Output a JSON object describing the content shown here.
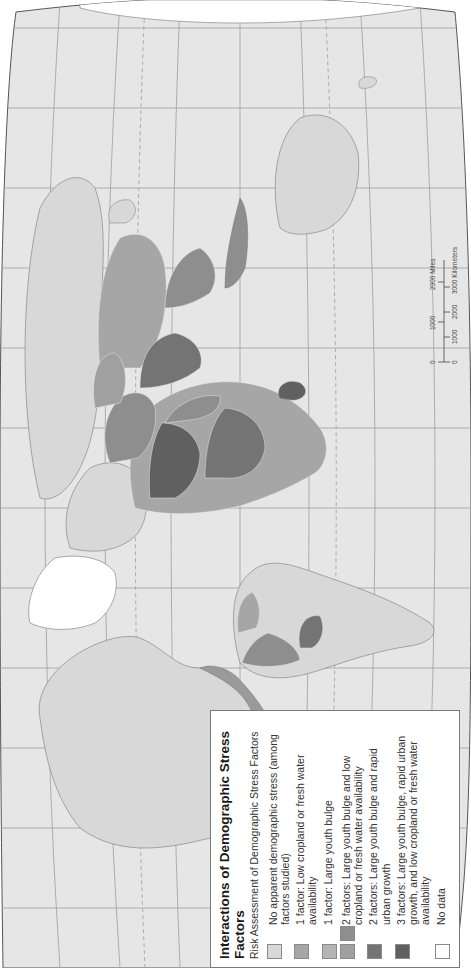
{
  "legend": {
    "title": "Interactions of Demographic Stress Factors",
    "subtitle": "Risk Assessment of Demographic Stress Factors",
    "items": [
      {
        "label": "No apparent demographic stress (among factors studied)",
        "colors": [
          "#d8d8d8"
        ]
      },
      {
        "label": "1 factor: Low cropland or fresh water availability",
        "colors": [
          "#a6a6a6"
        ]
      },
      {
        "label": "1 factor: Large youth bulge",
        "colors": [
          "#b4b4b4"
        ]
      },
      {
        "label": "2 factors: Large youth bulge and low cropland or fresh water availability",
        "colors": [
          "#a0a0a0",
          "#8e8e8e"
        ]
      },
      {
        "label": "2 factors: Large youth bulge and rapid urban growth",
        "colors": [
          "#747474"
        ]
      },
      {
        "label": "3 factors: Large youth bulge, rapid urban growth, and low cropland or fresh water availability",
        "colors": [
          "#606060"
        ]
      },
      {
        "label": "No data",
        "colors": [
          "#ffffff"
        ]
      }
    ]
  },
  "scale_bar": {
    "miles": {
      "ticks": [
        "0",
        "1000",
        "2000"
      ],
      "unit": "2000 Miles"
    },
    "kilometers": {
      "ticks": [
        "0",
        "1000",
        "2000",
        "3000"
      ],
      "unit": "3000 Kilometers"
    }
  },
  "colors": {
    "ocean": "#e8e8e8",
    "land_no_stress": "#d8d8d8",
    "graticule": "#9a9a9a",
    "no_data": "#ffffff"
  }
}
